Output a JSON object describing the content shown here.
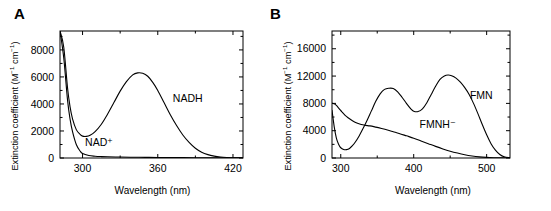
{
  "figure": {
    "background": "#ffffff",
    "line_color": "#000000",
    "panels": [
      {
        "id": "A",
        "letter": "A",
        "chart_index": 0
      },
      {
        "id": "B",
        "letter": "B",
        "chart_index": 1
      }
    ]
  },
  "labels": {
    "ylabel_main": "Extinction coefficient (M",
    "ylabel_sup1": "−1",
    "ylabel_mid": " cm",
    "ylabel_sup2": "−1",
    "ylabel_end": ")",
    "xlabel": "Wavelength  (nm)",
    "panel_a_letter": "A",
    "panel_b_letter": "B"
  },
  "chart_data": [
    {
      "type": "line",
      "panel": "A",
      "title": "",
      "xlabel": "Wavelength  (nm)",
      "ylabel": "Extinction coefficient (M−1 cm−1)",
      "xlim": [
        282,
        428
      ],
      "ylim": [
        0,
        9400
      ],
      "xticks": [
        300,
        360,
        420
      ],
      "xtick_labels": [
        "300",
        "360",
        "420"
      ],
      "xminor_ticks": [
        330,
        390
      ],
      "yticks": [
        0,
        2000,
        4000,
        6000,
        8000
      ],
      "ytick_labels": [
        "0",
        "2000",
        "4000",
        "6000",
        "8000"
      ],
      "yminor_ticks": [
        1000,
        3000,
        5000,
        7000,
        9000
      ],
      "grid": false,
      "legend_position": "inline-annotation",
      "annotations": [
        {
          "text": "NADH",
          "x": 372,
          "y": 4150
        },
        {
          "text": "NAD⁺",
          "x": 302,
          "y": 900
        }
      ],
      "series": [
        {
          "name": "NADH",
          "label": "NADH",
          "x": [
            282,
            285,
            288,
            290,
            292,
            295,
            298,
            300,
            303,
            306,
            310,
            315,
            320,
            325,
            330,
            335,
            340,
            344,
            348,
            352,
            356,
            360,
            365,
            370,
            375,
            380,
            385,
            390,
            395,
            400,
            405,
            410,
            415,
            420,
            428
          ],
          "values": [
            9400,
            8200,
            5200,
            3800,
            2900,
            2100,
            1750,
            1620,
            1600,
            1680,
            1950,
            2500,
            3250,
            4100,
            4950,
            5650,
            6150,
            6300,
            6270,
            6050,
            5600,
            5000,
            4100,
            3200,
            2400,
            1700,
            1150,
            720,
            430,
            250,
            140,
            75,
            40,
            20,
            8
          ]
        },
        {
          "name": "NAD+",
          "label": "NAD⁺",
          "x": [
            282,
            285,
            288,
            290,
            292,
            295,
            298,
            300,
            305,
            310,
            315,
            320,
            330,
            340,
            350,
            360,
            380,
            400,
            420,
            428
          ],
          "values": [
            9400,
            7400,
            4300,
            2900,
            1950,
            1000,
            520,
            330,
            180,
            130,
            105,
            90,
            70,
            58,
            48,
            40,
            28,
            18,
            10,
            6
          ]
        }
      ]
    },
    {
      "type": "line",
      "panel": "B",
      "title": "",
      "xlabel": "Wavelength  (nm)",
      "ylabel": "Extinction coefficient (M−1 cm−1)",
      "xlim": [
        288,
        532
      ],
      "ylim": [
        0,
        18600
      ],
      "xticks": [
        300,
        400,
        500
      ],
      "xtick_labels": [
        "300",
        "400",
        "500"
      ],
      "xminor_ticks": [
        350,
        450
      ],
      "yticks": [
        0,
        4000,
        8000,
        12000,
        16000
      ],
      "ytick_labels": [
        "0",
        "4000",
        "8000",
        "12000",
        "16000"
      ],
      "yminor_ticks": [
        2000,
        6000,
        10000,
        14000,
        18000
      ],
      "grid": false,
      "legend_position": "inline-annotation",
      "annotations": [
        {
          "text": "FMN",
          "x": 477,
          "y": 8600
        },
        {
          "text": "FMNH⁻",
          "x": 408,
          "y": 4450
        }
      ],
      "series": [
        {
          "name": "FMN",
          "label": "FMN",
          "x": [
            288,
            291,
            294,
            297,
            300,
            304,
            308,
            312,
            316,
            320,
            325,
            330,
            336,
            342,
            348,
            354,
            360,
            366,
            372,
            378,
            384,
            390,
            396,
            400,
            406,
            412,
            418,
            424,
            430,
            436,
            442,
            447,
            452,
            458,
            464,
            470,
            476,
            482,
            488,
            494,
            500,
            506,
            512,
            518,
            524,
            532
          ],
          "values": [
            7000,
            4600,
            2900,
            2000,
            1500,
            1250,
            1230,
            1400,
            1800,
            2350,
            3200,
            4200,
            5500,
            6900,
            8300,
            9400,
            10050,
            10220,
            10180,
            9700,
            8900,
            8000,
            7200,
            6850,
            6800,
            7200,
            8100,
            9300,
            10500,
            11500,
            12000,
            12150,
            12050,
            11700,
            11100,
            10300,
            9300,
            8000,
            6500,
            4900,
            3400,
            2100,
            1150,
            520,
            180,
            30
          ]
        },
        {
          "name": "FMNH-",
          "label": "FMNH⁻",
          "x": [
            288,
            291,
            294,
            298,
            302,
            306,
            310,
            316,
            322,
            328,
            334,
            340,
            348,
            356,
            364,
            372,
            380,
            390,
            400,
            410,
            420,
            430,
            440,
            450,
            460,
            470,
            480,
            490,
            500,
            510,
            520,
            532
          ],
          "values": [
            8000,
            7950,
            7700,
            7200,
            6700,
            6250,
            5900,
            5450,
            5120,
            4900,
            4780,
            4700,
            4520,
            4320,
            4100,
            3850,
            3600,
            3250,
            2900,
            2500,
            2100,
            1700,
            1330,
            1000,
            720,
            480,
            300,
            170,
            90,
            45,
            20,
            8
          ]
        }
      ]
    }
  ]
}
